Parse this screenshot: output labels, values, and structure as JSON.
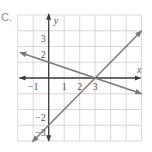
{
  "figure": {
    "part_label": "C."
  },
  "chart_data": {
    "type": "line",
    "title": "",
    "xlabel": "x",
    "ylabel": "y",
    "xlim": [
      -2,
      6
    ],
    "ylim": [
      -4,
      4
    ],
    "grid": true,
    "grid_step": 1,
    "x_tick_labels": [
      {
        "value": -1,
        "label": "−1"
      },
      {
        "value": 1,
        "label": "1"
      },
      {
        "value": 2,
        "label": "2"
      },
      {
        "value": 3,
        "label": "3"
      }
    ],
    "y_tick_labels": [
      {
        "value": 3,
        "label": "3"
      },
      {
        "value": 2,
        "label": "2"
      },
      {
        "value": -2,
        "label": "−2"
      },
      {
        "value": -3,
        "label": "−3"
      }
    ],
    "series": [
      {
        "name": "line-1",
        "equation": "y = -x/3 + 1",
        "slope": -0.3333,
        "intercept": 1,
        "x": [
          -1.85,
          6.0
        ],
        "y": [
          1.62,
          -1.0
        ],
        "arrows": "both"
      },
      {
        "name": "line-2",
        "equation": "y = x - 3",
        "slope": 1,
        "intercept": -3,
        "x": [
          -1.05,
          6.0
        ],
        "y": [
          -4.05,
          3.0
        ],
        "arrows": "both"
      }
    ],
    "intersection": {
      "x": 3,
      "y": 0
    },
    "legend": null
  },
  "colors": {
    "grid": "#cfcfcf",
    "axis": "#3c3c3c",
    "lines": "#787878",
    "text": "#555555"
  }
}
